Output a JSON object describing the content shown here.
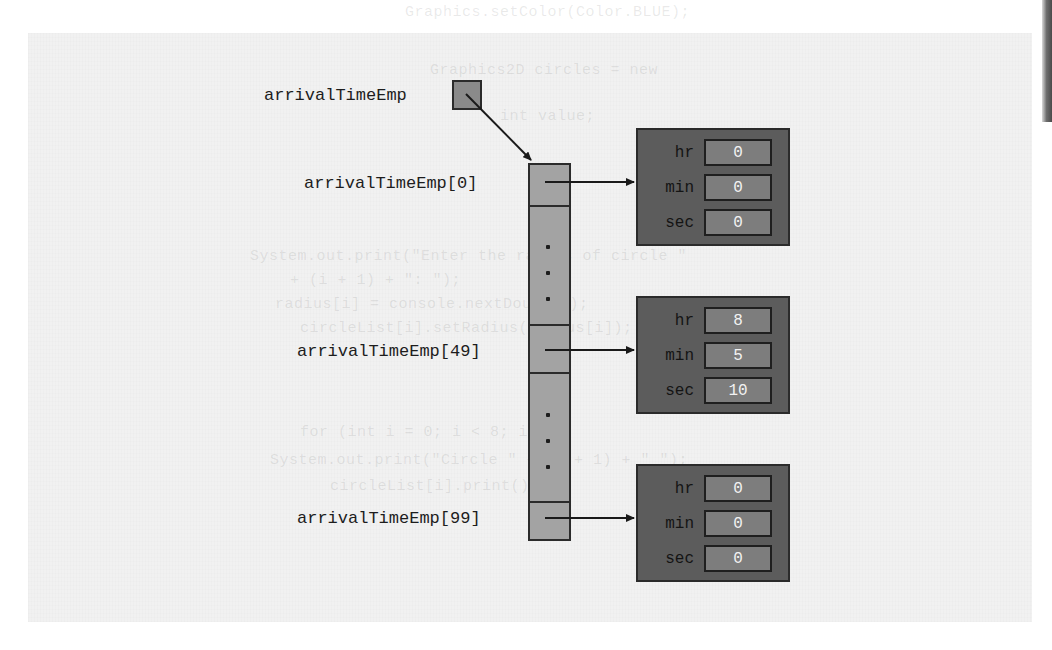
{
  "figure": {
    "kind": "array-of-structs-memory-diagram",
    "pointer_label": "arrivalTimeEmp",
    "array_element_labels": [
      "arrivalTimeEmp[0]",
      "arrivalTimeEmp[49]",
      "arrivalTimeEmp[99]"
    ],
    "struct_field_names": [
      "hr",
      "min",
      "sec"
    ],
    "structs": [
      {
        "hr": "0",
        "min": "0",
        "sec": "0"
      },
      {
        "hr": "8",
        "min": "5",
        "sec": "10"
      },
      {
        "hr": "0",
        "min": "0",
        "sec": "0"
      }
    ],
    "ellipsis_glyph": "·"
  },
  "colors": {
    "paper": "#f1f1f1",
    "array_fill": "#a3a3a3",
    "pointer_fill": "#8a8a8a",
    "struct_fill": "#5c5c5c",
    "value_fill": "#7d7d7d",
    "outline": "#2b2b2b",
    "value_text": "#f2f2f2",
    "label_text": "#1d1d1d"
  },
  "bleed_through_text": {
    "line_1": "Graphics.setColor(Color.BLUE);",
    "line_2": "Graphics2D circles = new",
    "line_3": "int value;",
    "line_4": "System.out.print(\"Enter the radius of circle \"",
    "line_5": "+ (i + 1) + \": \");",
    "line_6": "radius[i] = console.nextDouble();",
    "line_7": "circleList[i].setRadius(radius[i]);",
    "line_8": "for (int i = 0; i < 8; i++)",
    "line_9": "System.out.print(\"Circle \" + (i + 1) + \" \");",
    "line_10": "circleList[i].print();"
  }
}
